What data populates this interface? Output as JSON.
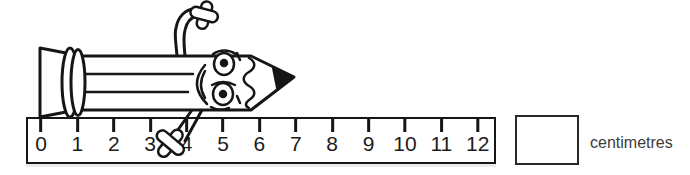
{
  "worksheet": {
    "answer_value": "",
    "unit_label": "centimetres"
  },
  "ruler": {
    "min": 0,
    "max": 12,
    "numbers": [
      "0",
      "1",
      "2",
      "3",
      "4",
      "5",
      "6",
      "7",
      "8",
      "9",
      "10",
      "11",
      "12"
    ]
  },
  "illustration": {
    "description": "Cartoon pencil character with face, waving arm and leg, lying along the top of the ruler",
    "pencil_start_cm": 0,
    "pencil_end_cm": 7
  },
  "colors": {
    "ink": "#161616",
    "background": "#ffffff",
    "label_text": "#3c3c3c"
  }
}
